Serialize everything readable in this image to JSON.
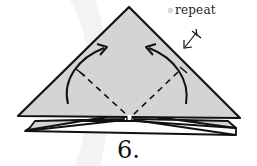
{
  "diagram": {
    "type": "origami-instruction",
    "step": {
      "number_label": "6."
    },
    "annotation": {
      "repeat_label": "repeat",
      "repeat_symbol": "turn-over-arrow-icon"
    },
    "shapes": {
      "main_triangle": {
        "fill": "#d4d4d4",
        "stroke": "#111111"
      },
      "lower_layer": {
        "fill": "#d4d4d4",
        "stroke": "#111111"
      },
      "bottom_layer": {
        "fill": "#ffffff",
        "stroke": "#111111"
      }
    },
    "folds": [
      {
        "type": "valley-fold",
        "side": "left",
        "line": "dashed"
      },
      {
        "type": "valley-fold",
        "side": "right",
        "line": "dashed"
      }
    ],
    "arrows": [
      {
        "side": "left",
        "direction": "fold-up-toward-apex"
      },
      {
        "side": "right",
        "direction": "fold-up-toward-apex"
      }
    ],
    "colors": {
      "paper": "#d4d4d4",
      "line": "#111111",
      "background": "#ffffff",
      "watermark": "#f2f2f2"
    }
  }
}
